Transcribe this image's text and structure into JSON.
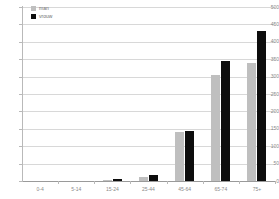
{
  "chart_data": {
    "type": "bar",
    "title": "",
    "xlabel": "",
    "ylabel": "",
    "ylim": [
      0,
      500
    ],
    "ytick_step": 50,
    "grid": true,
    "legend_position": "top-left",
    "categories": [
      "0-4",
      "5-14",
      "15-24",
      "25-44",
      "45-64",
      "65-74",
      "75+"
    ],
    "yticks": [
      "500",
      "450",
      "400",
      "350",
      "300",
      "250",
      "200",
      "150",
      "100",
      "50",
      "0"
    ],
    "series": [
      {
        "name": "man",
        "color": "#bfbfbf",
        "values": [
          0,
          0,
          3,
          12,
          140,
          305,
          340
        ]
      },
      {
        "name": "vrouw",
        "color": "#0d0d0d",
        "values": [
          0,
          0,
          5,
          18,
          145,
          345,
          432
        ]
      }
    ]
  },
  "legend": {
    "items": [
      {
        "label": "man",
        "color": "#bfbfbf"
      },
      {
        "label": "vrouw",
        "color": "#0d0d0d"
      }
    ]
  },
  "colors": {
    "background": "#ffffff",
    "gridline": "#d8d8d8",
    "axis": "#b9b9b9",
    "tick_text": "#8a8a8a",
    "series_man": "#bfbfbf",
    "series_vrouw": "#0d0d0d"
  }
}
